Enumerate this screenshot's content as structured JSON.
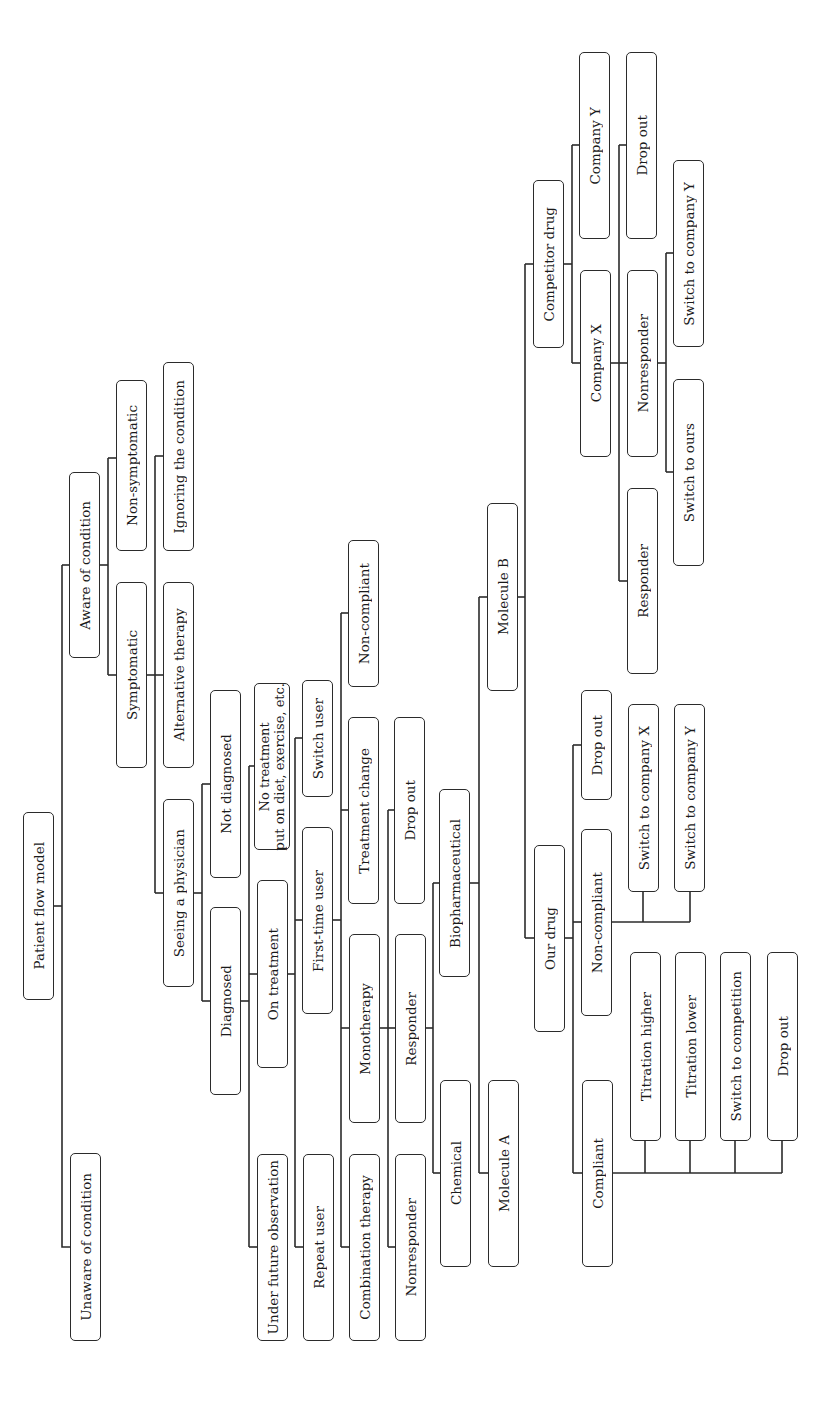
{
  "diagram": {
    "title": "Patient flow model",
    "orientation": "rotated-90-ccw",
    "nodes": [
      {
        "id": "root",
        "label": "Patient flow model",
        "x": 23,
        "y": 812,
        "w": 31,
        "h": 188
      },
      {
        "id": "unaware",
        "label": "Unaware of condition",
        "x": 70,
        "y": 1153,
        "w": 31,
        "h": 188
      },
      {
        "id": "aware",
        "label": "Aware of condition",
        "x": 69,
        "y": 472,
        "w": 31,
        "h": 186
      },
      {
        "id": "symptomatic",
        "label": "Symptomatic",
        "x": 116,
        "y": 582,
        "w": 31,
        "h": 186
      },
      {
        "id": "nonsymptomatic",
        "label": "Non-symptomatic",
        "x": 116,
        "y": 380,
        "w": 31,
        "h": 171
      },
      {
        "id": "alternative",
        "label": "Alternative therapy",
        "x": 163,
        "y": 582,
        "w": 31,
        "h": 186
      },
      {
        "id": "ignoring",
        "label": "Ignoring the condition",
        "x": 163,
        "y": 362,
        "w": 31,
        "h": 189
      },
      {
        "id": "physician",
        "label": "Seeing a physician",
        "x": 163,
        "y": 799,
        "w": 31,
        "h": 188
      },
      {
        "id": "notdiagnosed",
        "label": "Not diagnosed",
        "x": 210,
        "y": 690,
        "w": 31,
        "h": 188
      },
      {
        "id": "diagnosed",
        "label": "Diagnosed",
        "x": 210,
        "y": 907,
        "w": 31,
        "h": 188
      },
      {
        "id": "notreatment",
        "label": "No treatment\nput on diet, exercise, etc.",
        "x": 254,
        "y": 683,
        "w": 36,
        "h": 167,
        "two_line": true
      },
      {
        "id": "ontreatment",
        "label": "On treatment",
        "x": 257,
        "y": 880,
        "w": 31,
        "h": 188
      },
      {
        "id": "firsttime",
        "label": "First-time user",
        "x": 302,
        "y": 827,
        "w": 31,
        "h": 187
      },
      {
        "id": "switchuser",
        "label": "Switch user",
        "x": 302,
        "y": 680,
        "w": 31,
        "h": 117
      },
      {
        "id": "futureobs",
        "label": "Under future observation",
        "x": 257,
        "y": 1154,
        "w": 31,
        "h": 187
      },
      {
        "id": "repeat",
        "label": "Repeat user",
        "x": 303,
        "y": 1154,
        "w": 31,
        "h": 187
      },
      {
        "id": "treatchange",
        "label": "Treatment change",
        "x": 348,
        "y": 717,
        "w": 31,
        "h": 187
      },
      {
        "id": "noncompliant1",
        "label": "Non-compliant",
        "x": 348,
        "y": 540,
        "w": 31,
        "h": 147
      },
      {
        "id": "combination",
        "label": "Combination therapy",
        "x": 349,
        "y": 1154,
        "w": 31,
        "h": 187
      },
      {
        "id": "monotherapy",
        "label": "Monotherapy",
        "x": 349,
        "y": 934,
        "w": 31,
        "h": 189
      },
      {
        "id": "responder1",
        "label": "Responder",
        "x": 395,
        "y": 934,
        "w": 31,
        "h": 189
      },
      {
        "id": "dropout1",
        "label": "Drop out",
        "x": 394,
        "y": 717,
        "w": 31,
        "h": 187
      },
      {
        "id": "nonresponder1",
        "label": "Nonresponder",
        "x": 395,
        "y": 1154,
        "w": 31,
        "h": 187
      },
      {
        "id": "biopharma",
        "label": "Biopharmaceutical",
        "x": 439,
        "y": 789,
        "w": 31,
        "h": 188
      },
      {
        "id": "chemical",
        "label": "Chemical",
        "x": 440,
        "y": 1080,
        "w": 31,
        "h": 187
      },
      {
        "id": "moleculeA",
        "label": "Molecule A",
        "x": 488,
        "y": 1080,
        "w": 31,
        "h": 187
      },
      {
        "id": "moleculeB",
        "label": "Molecule B",
        "x": 487,
        "y": 503,
        "w": 31,
        "h": 188
      },
      {
        "id": "ourdrug",
        "label": "Our drug",
        "x": 534,
        "y": 845,
        "w": 31,
        "h": 187
      },
      {
        "id": "noncompliant2",
        "label": "Non-compliant",
        "x": 581,
        "y": 829,
        "w": 31,
        "h": 187
      },
      {
        "id": "dropout2",
        "label": "Drop out",
        "x": 581,
        "y": 690,
        "w": 31,
        "h": 110
      },
      {
        "id": "switchX",
        "label": "Switch to company X",
        "x": 628,
        "y": 704,
        "w": 31,
        "h": 188
      },
      {
        "id": "switchY",
        "label": "Switch to company Y",
        "x": 674,
        "y": 704,
        "w": 31,
        "h": 188
      },
      {
        "id": "compliant",
        "label": "Compliant",
        "x": 582,
        "y": 1080,
        "w": 31,
        "h": 187
      },
      {
        "id": "titrhigh",
        "label": "Titration higher",
        "x": 630,
        "y": 952,
        "w": 31,
        "h": 189
      },
      {
        "id": "titrlow",
        "label": "Titration lower",
        "x": 675,
        "y": 952,
        "w": 31,
        "h": 189
      },
      {
        "id": "switchcomp",
        "label": "Switch to competition",
        "x": 720,
        "y": 952,
        "w": 31,
        "h": 189
      },
      {
        "id": "dropout4",
        "label": "Drop out",
        "x": 767,
        "y": 952,
        "w": 31,
        "h": 189
      },
      {
        "id": "competitor",
        "label": "Competitor drug",
        "x": 533,
        "y": 180,
        "w": 31,
        "h": 168
      },
      {
        "id": "companyX",
        "label": "Company X",
        "x": 580,
        "y": 270,
        "w": 31,
        "h": 187
      },
      {
        "id": "companyY",
        "label": "Company Y",
        "x": 579,
        "y": 52,
        "w": 31,
        "h": 187
      },
      {
        "id": "responder2",
        "label": "Responder",
        "x": 627,
        "y": 488,
        "w": 31,
        "h": 186
      },
      {
        "id": "nonresponder2",
        "label": "Nonresponder",
        "x": 627,
        "y": 270,
        "w": 31,
        "h": 187
      },
      {
        "id": "dropout3",
        "label": "Drop out",
        "x": 626,
        "y": 52,
        "w": 31,
        "h": 187
      },
      {
        "id": "switchours",
        "label": "Switch to ours",
        "x": 673,
        "y": 379,
        "w": 31,
        "h": 187
      },
      {
        "id": "switchY2",
        "label": "Switch to company Y",
        "x": 673,
        "y": 160,
        "w": 31,
        "h": 187
      }
    ],
    "edges": [
      [
        "root",
        "unaware"
      ],
      [
        "root",
        "aware"
      ],
      [
        "aware",
        "symptomatic"
      ],
      [
        "aware",
        "nonsymptomatic"
      ],
      [
        "symptomatic",
        "physician"
      ],
      [
        "symptomatic",
        "alternative"
      ],
      [
        "symptomatic",
        "ignoring"
      ],
      [
        "physician",
        "diagnosed"
      ],
      [
        "physician",
        "notdiagnosed"
      ],
      [
        "diagnosed",
        "futureobs"
      ],
      [
        "diagnosed",
        "ontreatment"
      ],
      [
        "diagnosed",
        "notreatment"
      ],
      [
        "ontreatment",
        "repeat"
      ],
      [
        "ontreatment",
        "firsttime"
      ],
      [
        "ontreatment",
        "switchuser"
      ],
      [
        "firsttime",
        "combination"
      ],
      [
        "firsttime",
        "monotherapy"
      ],
      [
        "firsttime",
        "treatchange"
      ],
      [
        "firsttime",
        "noncompliant1"
      ],
      [
        "monotherapy",
        "nonresponder1"
      ],
      [
        "monotherapy",
        "responder1"
      ],
      [
        "monotherapy",
        "dropout1"
      ],
      [
        "responder1",
        "chemical"
      ],
      [
        "responder1",
        "biopharma"
      ],
      [
        "biopharma",
        "moleculeA"
      ],
      [
        "biopharma",
        "moleculeB"
      ],
      [
        "moleculeB",
        "ourdrug"
      ],
      [
        "moleculeB",
        "competitor"
      ],
      [
        "ourdrug",
        "compliant"
      ],
      [
        "ourdrug",
        "noncompliant2"
      ],
      [
        "ourdrug",
        "dropout2"
      ],
      [
        "noncompliant2",
        "switchX"
      ],
      [
        "noncompliant2",
        "switchY"
      ],
      [
        "compliant",
        "titrhigh"
      ],
      [
        "compliant",
        "titrlow"
      ],
      [
        "compliant",
        "switchcomp"
      ],
      [
        "compliant",
        "dropout4"
      ],
      [
        "competitor",
        "companyX"
      ],
      [
        "competitor",
        "companyY"
      ],
      [
        "companyX",
        "responder2"
      ],
      [
        "companyX",
        "nonresponder2"
      ],
      [
        "companyX",
        "dropout3"
      ],
      [
        "nonresponder2",
        "switchours"
      ],
      [
        "nonresponder2",
        "switchY2"
      ]
    ]
  },
  "colors": {
    "line": "#2b2b2b",
    "box_border": "#2b2b2b",
    "background": "#ffffff",
    "text": "#1a1a1a"
  }
}
